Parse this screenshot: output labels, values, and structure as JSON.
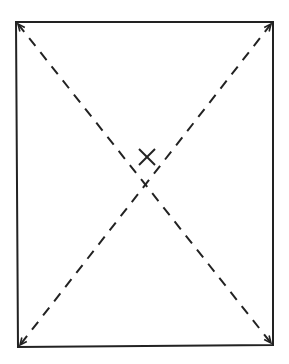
{
  "diagram": {
    "type": "rectangle-with-diagonals",
    "colors": {
      "background": "#ffffff",
      "stroke": "#222222"
    },
    "rectangle": {
      "top_left": [
        16,
        22
      ],
      "top_right": [
        273,
        22
      ],
      "bottom_right": [
        273,
        345
      ],
      "bottom_left": [
        18,
        347
      ],
      "stroke_width": 2
    },
    "diagonals": [
      {
        "from": [
          18,
          24
        ],
        "to": [
          271,
          343
        ],
        "style": "dashed"
      },
      {
        "from": [
          271,
          24
        ],
        "to": [
          20,
          345
        ],
        "style": "dashed"
      }
    ],
    "dash_pattern": [
      10,
      8
    ],
    "center_mark": {
      "glyph": "X",
      "center": [
        147,
        157
      ],
      "size": 16
    }
  }
}
